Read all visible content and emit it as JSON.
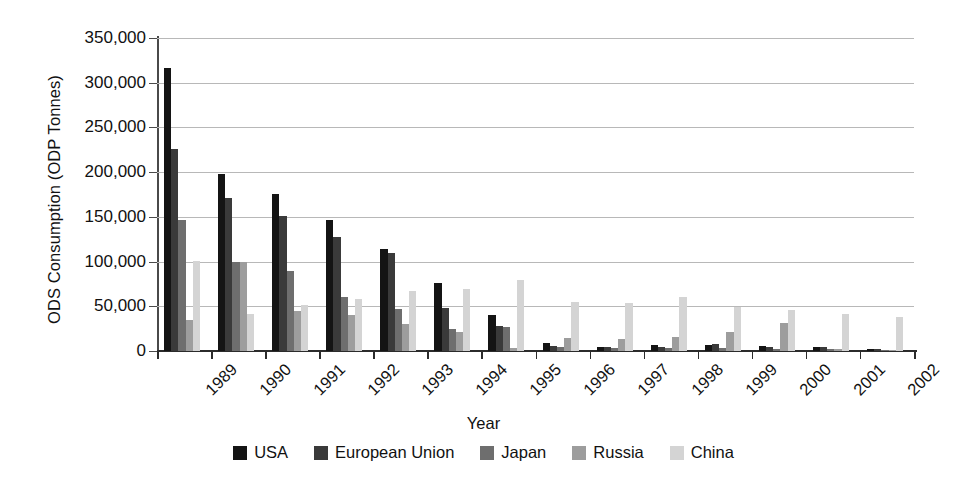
{
  "chart_data": {
    "type": "bar",
    "title": "",
    "xlabel": "Year",
    "ylabel": "ODS Consumption (ODP Tonnes)",
    "ylim": [
      0,
      350000
    ],
    "ytick_labels": [
      "350,000",
      "300,000",
      "250,000",
      "200,000",
      "150,000",
      "100,000",
      "50,000",
      "0"
    ],
    "ytick_values": [
      350000,
      300000,
      250000,
      200000,
      150000,
      100000,
      50000,
      0
    ],
    "grid": true,
    "legend_position": "bottom",
    "categories": [
      "1989",
      "1990",
      "1991",
      "1992",
      "1993",
      "1994",
      "1995",
      "1996",
      "1997",
      "1998",
      "1999",
      "2000",
      "2001",
      "2002"
    ],
    "series": [
      {
        "name": "USA",
        "color": "#141414",
        "values": [
          317000,
          198000,
          176000,
          146000,
          114000,
          76000,
          40000,
          9000,
          5000,
          7000,
          7000,
          6000,
          4000,
          2000
        ]
      },
      {
        "name": "European Union",
        "color": "#3a3a3a",
        "values": [
          226000,
          171000,
          151000,
          128000,
          110000,
          48000,
          28000,
          6000,
          4000,
          4000,
          8000,
          4000,
          5000,
          2000
        ]
      },
      {
        "name": "Japan",
        "color": "#6e6e6e",
        "values": [
          146000,
          99000,
          89000,
          60000,
          47000,
          25000,
          27000,
          5000,
          3000,
          3000,
          3000,
          2000,
          2000,
          1000
        ]
      },
      {
        "name": "Russia",
        "color": "#9d9d9d",
        "values": [
          35000,
          99000,
          45000,
          40000,
          30000,
          21000,
          3000,
          15000,
          13000,
          16000,
          21000,
          31000,
          2000,
          1000
        ]
      },
      {
        "name": "China",
        "color": "#d4d4d4",
        "values": [
          101000,
          41000,
          51000,
          58000,
          67000,
          69000,
          79000,
          55000,
          54000,
          60000,
          49000,
          46000,
          41000,
          38000
        ]
      }
    ]
  }
}
